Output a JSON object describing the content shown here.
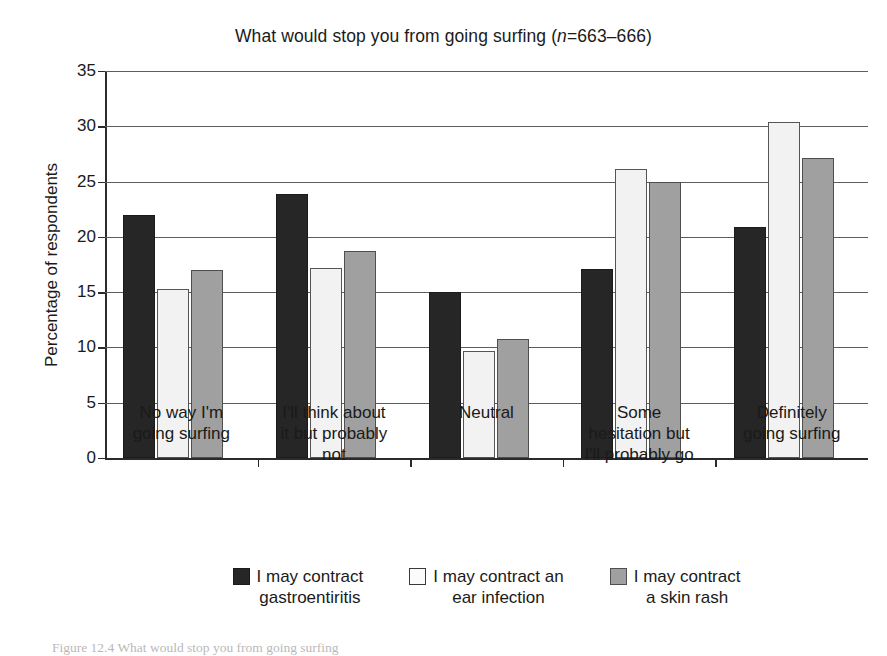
{
  "figure": {
    "caption": "Figure 12.4 What would stop you from going surfing"
  },
  "chart_data": {
    "type": "bar",
    "title": "What would stop you from going surfing (n=663–666)",
    "title_prefix": "What would stop you from going surfing (",
    "title_n_italic": "n",
    "title_suffix": "=663–666)",
    "xlabel": "",
    "ylabel": "Percentage of respondents",
    "ylim": [
      0,
      35
    ],
    "yticks": [
      0,
      5,
      10,
      15,
      20,
      25,
      30,
      35
    ],
    "ytick_labels": [
      "0",
      "5",
      "10",
      "15",
      "20",
      "25",
      "30",
      "35"
    ],
    "grid": true,
    "grid_axis": "y",
    "legend_position": "bottom",
    "categories": [
      "No way I'm\ngoing surfing",
      "I'll think about\nit but probably\nnot",
      "Neutral",
      "Some\nhesitation but\nI'll probably go",
      "Definitely\ngoing surfing"
    ],
    "series": [
      {
        "name": "I may contract gastroentiritis",
        "legend_label": "I may contract\ngastroentiritis",
        "color": "#262626",
        "values": [
          22.0,
          23.9,
          15.0,
          17.1,
          20.9
        ]
      },
      {
        "name": "I may contract an ear infection",
        "legend_label": "I may contract an\near infection",
        "color": "#f2f2f2",
        "values": [
          15.3,
          17.2,
          9.7,
          26.1,
          30.4
        ]
      },
      {
        "name": "I may contract a skin rash",
        "legend_label": "I may contract\na skin rash",
        "color": "#a0a0a0",
        "values": [
          17.0,
          18.7,
          10.8,
          25.0,
          27.1
        ]
      }
    ]
  }
}
